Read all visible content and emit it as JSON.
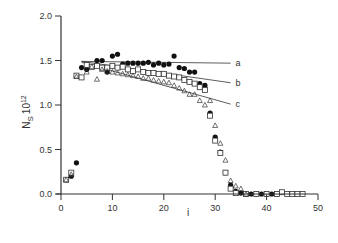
{
  "chart_data": {
    "type": "scatter",
    "title": "",
    "xlabel": "i",
    "ylabel": "N_S 10^12",
    "xlim": [
      0,
      50
    ],
    "ylim": [
      0.0,
      2.0
    ],
    "xticks": [
      "0",
      "10",
      "20",
      "30",
      "40",
      "50"
    ],
    "yticks": [
      "0.0",
      "0.5",
      "1.0",
      "1.5",
      "2.0"
    ],
    "grid": false,
    "legend": null,
    "series": [
      {
        "name": "filled circles",
        "marker": "filled-circle",
        "points": [
          [
            2,
            0.2
          ],
          [
            3,
            0.35
          ],
          [
            4,
            1.42
          ],
          [
            5,
            1.4
          ],
          [
            6,
            1.43
          ],
          [
            7,
            1.5
          ],
          [
            8,
            1.5
          ],
          [
            9,
            1.37
          ],
          [
            10,
            1.55
          ],
          [
            11,
            1.57
          ],
          [
            12,
            1.46
          ],
          [
            13,
            1.47
          ],
          [
            14,
            1.47
          ],
          [
            15,
            1.47
          ],
          [
            16,
            1.47
          ],
          [
            17,
            1.48
          ],
          [
            18,
            1.45
          ],
          [
            19,
            1.47
          ],
          [
            20,
            1.45
          ],
          [
            21,
            1.46
          ],
          [
            22,
            1.55
          ],
          [
            23,
            1.42
          ],
          [
            24,
            1.41
          ],
          [
            25,
            1.37
          ],
          [
            26,
            1.37
          ],
          [
            27,
            1.24
          ],
          [
            28,
            1.22
          ],
          [
            29,
            0.91
          ],
          [
            30,
            0.64
          ],
          [
            31,
            0.47
          ],
          [
            32,
            0.24
          ],
          [
            33,
            0.1
          ],
          [
            34,
            0.03
          ],
          [
            35,
            0.01
          ],
          [
            36,
            0.0
          ],
          [
            37,
            0.0
          ],
          [
            38,
            0.0
          ],
          [
            39,
            0.0
          ],
          [
            40,
            0.0
          ],
          [
            41,
            0.0
          ],
          [
            42,
            0.0
          ]
        ]
      },
      {
        "name": "open squares",
        "marker": "open-square",
        "points": [
          [
            1,
            0.16
          ],
          [
            2,
            0.24
          ],
          [
            3,
            1.33
          ],
          [
            4,
            1.31
          ],
          [
            5,
            1.45
          ],
          [
            6,
            1.43
          ],
          [
            7,
            1.44
          ],
          [
            8,
            1.42
          ],
          [
            9,
            1.42
          ],
          [
            10,
            1.44
          ],
          [
            11,
            1.42
          ],
          [
            12,
            1.43
          ],
          [
            13,
            1.4
          ],
          [
            14,
            1.38
          ],
          [
            15,
            1.4
          ],
          [
            16,
            1.37
          ],
          [
            17,
            1.36
          ],
          [
            18,
            1.36
          ],
          [
            19,
            1.35
          ],
          [
            20,
            1.35
          ],
          [
            21,
            1.33
          ],
          [
            22,
            1.32
          ],
          [
            23,
            1.31
          ],
          [
            24,
            1.28
          ],
          [
            25,
            1.26
          ],
          [
            26,
            1.24
          ],
          [
            27,
            1.2
          ],
          [
            28,
            1.17
          ],
          [
            29,
            0.88
          ],
          [
            30,
            0.6
          ],
          [
            31,
            0.46
          ],
          [
            32,
            0.24
          ],
          [
            33,
            0.06
          ],
          [
            34,
            0.01
          ],
          [
            36,
            0.0
          ],
          [
            38,
            0.0
          ],
          [
            40,
            0.0
          ],
          [
            42,
            0.0
          ],
          [
            43,
            0.02
          ],
          [
            44,
            0.0
          ],
          [
            45,
            0.0
          ],
          [
            46,
            0.0
          ],
          [
            47,
            0.0
          ]
        ]
      },
      {
        "name": "open triangles",
        "marker": "open-triangle",
        "points": [
          [
            1,
            0.16
          ],
          [
            2,
            0.22
          ],
          [
            3,
            1.32
          ],
          [
            5,
            1.37
          ],
          [
            6,
            1.43
          ],
          [
            7,
            1.29
          ],
          [
            8,
            1.4
          ],
          [
            9,
            1.38
          ],
          [
            10,
            1.37
          ],
          [
            11,
            1.36
          ],
          [
            12,
            1.35
          ],
          [
            13,
            1.34
          ],
          [
            14,
            1.33
          ],
          [
            15,
            1.32
          ],
          [
            16,
            1.3
          ],
          [
            17,
            1.3
          ],
          [
            18,
            1.28
          ],
          [
            19,
            1.27
          ],
          [
            20,
            1.26
          ],
          [
            21,
            1.25
          ],
          [
            22,
            1.22
          ],
          [
            23,
            1.19
          ],
          [
            24,
            1.16
          ],
          [
            25,
            1.12
          ],
          [
            26,
            1.12
          ],
          [
            27,
            1.05
          ],
          [
            28,
            1.0
          ],
          [
            29,
            1.05
          ],
          [
            30,
            0.77
          ],
          [
            31,
            0.57
          ],
          [
            32,
            0.38
          ],
          [
            33,
            0.15
          ],
          [
            34,
            0.09
          ],
          [
            35,
            0.06
          ],
          [
            36,
            0.0
          ]
        ]
      }
    ],
    "fit_lines": [
      {
        "label": "a",
        "x": [
          4,
          33
        ],
        "y": [
          1.49,
          1.47
        ]
      },
      {
        "label": "b",
        "x": [
          4,
          33
        ],
        "y": [
          1.49,
          1.25
        ]
      },
      {
        "label": "c",
        "x": [
          4,
          33
        ],
        "y": [
          1.48,
          1.01
        ]
      }
    ]
  }
}
